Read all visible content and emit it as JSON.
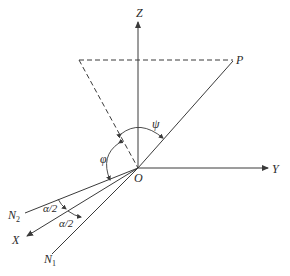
{
  "diagram": {
    "type": "geometry-angle-diagram",
    "axes": {
      "z_label": "Z",
      "y_label": "Y",
      "x_label": "X",
      "origin_label": "O"
    },
    "points": {
      "p_label": "P"
    },
    "lines": {
      "n1_label": "N",
      "n1_sub": "1",
      "n2_label": "N",
      "n2_sub": "2"
    },
    "angles": {
      "psi_label": "ψ",
      "phi_label": "φ",
      "alpha_half_upper": "α/2",
      "alpha_half_lower": "α/2"
    },
    "colors": {
      "ink": "#3a3a3a",
      "background": "#ffffff"
    }
  }
}
